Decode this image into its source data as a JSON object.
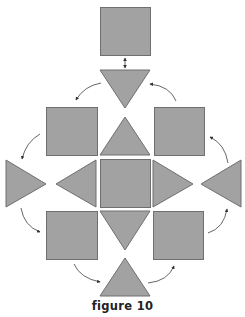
{
  "figure": {
    "caption": "figure 10",
    "colors": {
      "fill": "#a2a2a2",
      "stroke": "#6f6f6f",
      "arrow": "#555555",
      "caption": "#222222"
    },
    "shapes": [
      {
        "id": "top-square",
        "type": "square",
        "x": 100,
        "y": 7,
        "w": 50,
        "h": 48
      },
      {
        "id": "top-down-triangle",
        "type": "triangle-down",
        "points": "100,70 150,70 125,108"
      },
      {
        "id": "upper-left-square",
        "type": "square",
        "x": 46,
        "y": 107,
        "w": 51,
        "h": 48
      },
      {
        "id": "upper-center-up-triangle",
        "type": "triangle-up",
        "points": "100,155 150,155 125,117"
      },
      {
        "id": "upper-right-square",
        "type": "square",
        "x": 154,
        "y": 107,
        "w": 50,
        "h": 48
      },
      {
        "id": "far-left-right-triangle",
        "type": "triangle-right",
        "points": "6,160 6,207 46,184"
      },
      {
        "id": "inner-left-left-triangle",
        "type": "triangle-left",
        "points": "96,160 96,207 56,184"
      },
      {
        "id": "center-square",
        "type": "square",
        "x": 100,
        "y": 159,
        "w": 50,
        "h": 48
      },
      {
        "id": "inner-right-right-triangle",
        "type": "triangle-right",
        "points": "153,160 153,207 193,184"
      },
      {
        "id": "far-right-left-triangle",
        "type": "triangle-left",
        "points": "241,160 241,207 201,184"
      },
      {
        "id": "lower-left-square",
        "type": "square",
        "x": 46,
        "y": 211,
        "w": 51,
        "h": 48
      },
      {
        "id": "lower-center-down-triangle",
        "type": "triangle-down",
        "points": "100,211 150,211 125,250"
      },
      {
        "id": "lower-right-square",
        "type": "square",
        "x": 153,
        "y": 211,
        "w": 50,
        "h": 48
      },
      {
        "id": "bottom-up-triangle",
        "type": "triangle-up",
        "points": "100,296 150,296 125,258"
      }
    ],
    "arrows": [
      {
        "id": "double-arrow-top",
        "type": "bidirectional",
        "d": "M125,58 L125,68"
      },
      {
        "id": "arrow-1",
        "d": "M101,83 Q84,86 76,100"
      },
      {
        "id": "arrow-2",
        "d": "M40,134 Q26,142 22,159"
      },
      {
        "id": "arrow-3",
        "d": "M21,208 Q24,226 40,232"
      },
      {
        "id": "arrow-4",
        "d": "M74,264 Q80,278 100,282"
      },
      {
        "id": "arrow-5",
        "d": "M148,283 Q168,281 174,266"
      },
      {
        "id": "arrow-6",
        "d": "M208,233 Q224,228 227,209"
      },
      {
        "id": "arrow-7",
        "d": "M228,163 Q225,144 210,137"
      },
      {
        "id": "arrow-8",
        "d": "M176,101 Q170,86 150,84"
      }
    ]
  }
}
